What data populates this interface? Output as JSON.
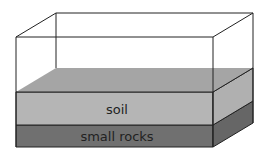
{
  "diagram": {
    "type": "terrarium-cross-section",
    "layers": [
      {
        "name": "soil",
        "label": "soil",
        "front_color": "#b5b5b5",
        "top_color": "#a5a5a5",
        "side_color": "#b0b0b0"
      },
      {
        "name": "small-rocks",
        "label": "small rocks",
        "front_color": "#707070",
        "side_color": "#666666"
      }
    ],
    "container": {
      "stroke": "#222222",
      "fill": "#ffffff"
    }
  }
}
